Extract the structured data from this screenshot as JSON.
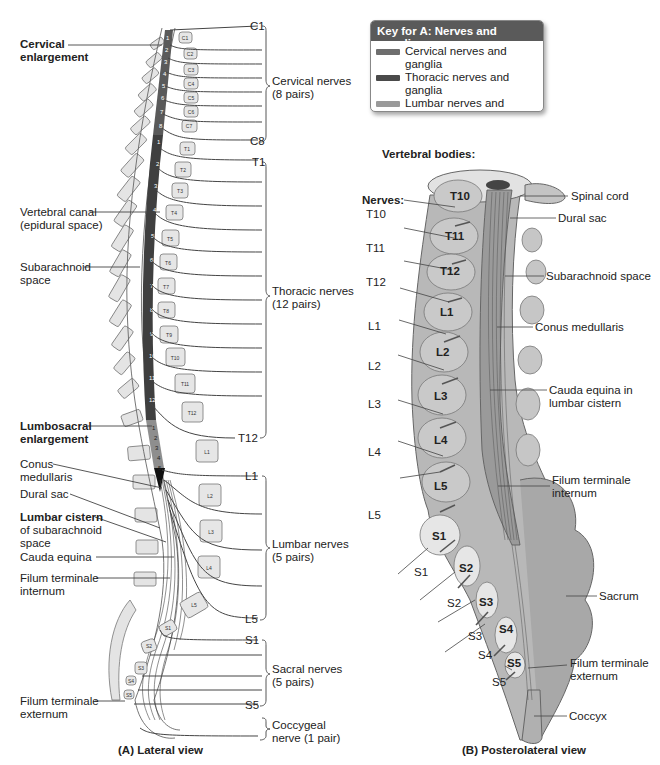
{
  "legend": {
    "title": "Key for A: Nerves and ganglia",
    "items": [
      {
        "label": "Cervical nerves and ganglia",
        "color": "#6e6e6e"
      },
      {
        "label": "Thoracic nerves and ganglia",
        "color": "#4a4a4a"
      },
      {
        "label": "Lumbar nerves and ganglia",
        "color": "#9a9a9a"
      },
      {
        "label": "Sacral and coccygeal nerves and ganglia",
        "label_line1": "Sacral and coccygeal",
        "label_line2": "nerves and ganglia",
        "color": "#151515"
      }
    ]
  },
  "view_a": {
    "caption": "(A) Lateral view",
    "left_labels": {
      "cervical_enlargement": [
        "Cervical",
        "enlargement"
      ],
      "vertebral_canal": [
        "Vertebral canal",
        "(epidural space)"
      ],
      "subarachnoid_space": [
        "Subarachnoid",
        "space"
      ],
      "lumbosacral_enlargement": [
        "Lumbosacral",
        "enlargement"
      ],
      "conus_medullaris": [
        "Conus",
        "medullaris"
      ],
      "dural_sac": "Dural sac",
      "lumbar_cistern": [
        "Lumbar cistern",
        "of subarachnoid",
        "space"
      ],
      "cauda_equina": "Cauda equina",
      "filum_internum": [
        "Filum terminale",
        "internum"
      ],
      "filum_externum": [
        "Filum terminale",
        "externum"
      ]
    },
    "nerve_groups": [
      {
        "first": "C1",
        "last": "C8",
        "label": [
          "Cervical nerves",
          "(8 pairs)"
        ]
      },
      {
        "first": "T1",
        "last": "T12",
        "label": [
          "Thoracic nerves",
          "(12 pairs)"
        ]
      },
      {
        "first": "L1",
        "last": "L5",
        "label": [
          "Lumbar nerves",
          "(5 pairs)"
        ]
      },
      {
        "first": "S1",
        "last": "S5",
        "label": [
          "Sacral nerves",
          "(5 pairs)"
        ]
      },
      {
        "first": "",
        "last": "",
        "label": [
          "Coccygeal",
          "nerve (1 pair)"
        ]
      }
    ],
    "vertebrae": [
      "C1",
      "C2",
      "C3",
      "C4",
      "C5",
      "C6",
      "C7",
      "T1",
      "T2",
      "T3",
      "T4",
      "T5",
      "T6",
      "T7",
      "T8",
      "T9",
      "T10",
      "T11",
      "T12",
      "L1",
      "L2",
      "L3",
      "L4",
      "L5",
      "S1",
      "S2",
      "S3",
      "S4",
      "S5"
    ],
    "cord_segment_numbers": {
      "cervical": [
        "1",
        "2",
        "3",
        "4",
        "5",
        "6",
        "7",
        "8"
      ],
      "thoracic": [
        "1",
        "2",
        "3",
        "4",
        "5",
        "6",
        "7",
        "8",
        "9",
        "10",
        "11",
        "12"
      ],
      "lumbar": [
        "1",
        "2",
        "3",
        "4",
        "5"
      ],
      "sacral": [
        "1",
        "2",
        "3"
      ]
    }
  },
  "view_b": {
    "caption": "(B) Posterolateral view",
    "vertebral_bodies_heading": "Vertebral bodies:",
    "nerves_heading": "Nerves:",
    "body_labels": [
      "T10",
      "T11",
      "T12",
      "L1",
      "L2",
      "L3",
      "L4",
      "L5",
      "S1",
      "S2",
      "S3",
      "S4",
      "S5"
    ],
    "nerve_labels": [
      "T10",
      "T11",
      "T12",
      "L1",
      "L2",
      "L3",
      "L4",
      "L5",
      "S1",
      "S2",
      "S3",
      "S4",
      "S5"
    ],
    "right_labels": {
      "spinal_cord": "Spinal cord",
      "dural_sac": "Dural sac",
      "subarachnoid_space": "Subarachnoid space",
      "conus_medullaris": "Conus medullaris",
      "cauda_equina": [
        "Cauda equina in",
        "lumbar cistern"
      ],
      "filum_internum": [
        "Filum terminale",
        "internum"
      ],
      "sacrum": "Sacrum",
      "filum_externum": [
        "Filum terminale",
        "externum"
      ],
      "coccyx": "Coccyx"
    }
  }
}
